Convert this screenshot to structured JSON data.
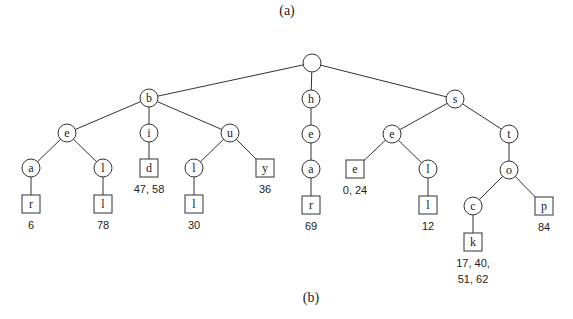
{
  "captions": {
    "top": "(a)",
    "bottom": "(b)"
  },
  "style": {
    "stroke_color": "#333333",
    "text_color": "#222222",
    "background": "#ffffff"
  },
  "tree": {
    "type": "compressed-trie / suffix trie",
    "nodes": [
      {
        "id": "root",
        "label": "",
        "shape": "circle",
        "x": 312,
        "y": 63
      },
      {
        "id": "b",
        "label": "b",
        "shape": "circle",
        "x": 149,
        "y": 98,
        "parent": "root"
      },
      {
        "id": "h",
        "label": "h",
        "shape": "circle",
        "x": 311,
        "y": 99,
        "parent": "root"
      },
      {
        "id": "s",
        "label": "s",
        "shape": "circle",
        "x": 455,
        "y": 99,
        "parent": "root"
      },
      {
        "id": "b-e",
        "label": "e",
        "shape": "circle",
        "x": 67,
        "y": 133,
        "parent": "b"
      },
      {
        "id": "b-i",
        "label": "i",
        "shape": "circle",
        "x": 149,
        "y": 133,
        "parent": "b"
      },
      {
        "id": "b-u",
        "label": "u",
        "shape": "circle",
        "x": 230,
        "y": 133,
        "parent": "b"
      },
      {
        "id": "b-e-a",
        "label": "a",
        "shape": "circle",
        "x": 31,
        "y": 168,
        "parent": "b-e"
      },
      {
        "id": "b-e-l",
        "label": "l",
        "shape": "circle",
        "x": 103,
        "y": 168,
        "parent": "b-e"
      },
      {
        "id": "b-i-d",
        "label": "d",
        "shape": "box",
        "x": 149,
        "y": 168,
        "parent": "b-i",
        "positions": "47, 58"
      },
      {
        "id": "b-u-l",
        "label": "l",
        "shape": "circle",
        "x": 194,
        "y": 168,
        "parent": "b-u"
      },
      {
        "id": "b-u-y",
        "label": "y",
        "shape": "box",
        "x": 265,
        "y": 168,
        "parent": "b-u",
        "positions": "36"
      },
      {
        "id": "b-e-a-r",
        "label": "r",
        "shape": "box",
        "x": 31,
        "y": 204,
        "parent": "b-e-a",
        "positions": "6"
      },
      {
        "id": "b-e-l-l",
        "label": "l",
        "shape": "box",
        "x": 103,
        "y": 204,
        "parent": "b-e-l",
        "positions": "78"
      },
      {
        "id": "b-u-l-l",
        "label": "l",
        "shape": "box",
        "x": 194,
        "y": 204,
        "parent": "b-u-l",
        "positions": "30"
      },
      {
        "id": "h-e",
        "label": "e",
        "shape": "circle",
        "x": 311,
        "y": 134,
        "parent": "h"
      },
      {
        "id": "h-e-a",
        "label": "a",
        "shape": "circle",
        "x": 311,
        "y": 169,
        "parent": "h-e"
      },
      {
        "id": "h-e-a-r",
        "label": "r",
        "shape": "box",
        "x": 311,
        "y": 205,
        "parent": "h-e-a",
        "positions": "69"
      },
      {
        "id": "s-e",
        "label": "e",
        "shape": "circle",
        "x": 392,
        "y": 134,
        "parent": "s"
      },
      {
        "id": "s-t",
        "label": "t",
        "shape": "circle",
        "x": 509,
        "y": 134,
        "parent": "s"
      },
      {
        "id": "s-e-e",
        "label": "e",
        "shape": "box",
        "x": 355,
        "y": 169,
        "parent": "s-e",
        "positions": "0, 24"
      },
      {
        "id": "s-e-l",
        "label": "l",
        "shape": "circle",
        "x": 428,
        "y": 169,
        "parent": "s-e"
      },
      {
        "id": "s-e-l-l",
        "label": "l",
        "shape": "box",
        "x": 428,
        "y": 205,
        "parent": "s-e-l",
        "positions": "12"
      },
      {
        "id": "s-t-o",
        "label": "o",
        "shape": "circle",
        "x": 509,
        "y": 170,
        "parent": "s-t"
      },
      {
        "id": "s-t-o-c",
        "label": "c",
        "shape": "circle",
        "x": 473,
        "y": 206,
        "parent": "s-t-o"
      },
      {
        "id": "s-t-o-p",
        "label": "p",
        "shape": "box",
        "x": 544,
        "y": 206,
        "parent": "s-t-o",
        "positions": "84"
      },
      {
        "id": "s-t-o-c-k",
        "label": "k",
        "shape": "box",
        "x": 473,
        "y": 242,
        "parent": "s-t-o-c",
        "positions": "17, 40,\n51, 62"
      }
    ]
  }
}
